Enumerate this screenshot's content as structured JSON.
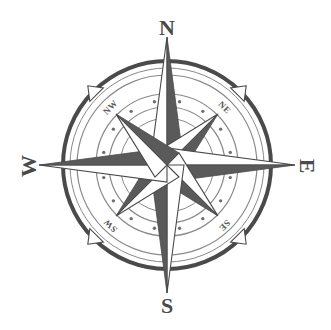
{
  "image": {
    "title": "Compass Rose",
    "kind": "compass-rose-illustration",
    "width": 331,
    "height": 330,
    "background_color": "#ffffff"
  },
  "colors": {
    "ink_dark": "#3f3f3f",
    "ink_mid": "#6b6b6b",
    "ink_light": "#8f8f8f",
    "ring_stroke": "#4a4a4a",
    "ring_thin": "#8a8a8a",
    "dot": "#6f6f6f",
    "star_dark": "#5a5a5a",
    "star_light": "#ffffff",
    "star_outline": "#4a4a4a",
    "label": "#4a4a4a"
  },
  "geometry": {
    "center_x": 167,
    "center_y": 165,
    "outer_ring_radius": 104,
    "outer_ring_width": 4,
    "mid_ring_radius": 90,
    "dot_ring_outer_radius": 71,
    "dot_ring_inner_radius": 58,
    "inner_ring_radius": 47,
    "cardinal_point_radius": 128,
    "intercardinal_point_radius": 72,
    "dot_count": 16
  },
  "labels": {
    "cardinal": [
      {
        "id": "north",
        "text": "N",
        "x": 167,
        "y": 30,
        "rotation": 0
      },
      {
        "id": "south",
        "text": "S",
        "x": 167,
        "y": 308,
        "rotation": 0
      },
      {
        "id": "west",
        "text": "W",
        "x": 31,
        "y": 166,
        "rotation": -90
      },
      {
        "id": "east",
        "text": "E",
        "x": 305,
        "y": 166,
        "rotation": 90
      }
    ],
    "intercardinal": [
      {
        "id": "northwest",
        "text": "NW",
        "x": 111,
        "y": 108,
        "rotation": -45
      },
      {
        "id": "northeast",
        "text": "NE",
        "x": 224,
        "y": 108,
        "rotation": 45
      },
      {
        "id": "southwest",
        "text": "SW",
        "x": 111,
        "y": 225,
        "rotation": -135
      },
      {
        "id": "southeast",
        "text": "SE",
        "x": 224,
        "y": 225,
        "rotation": 135
      }
    ]
  },
  "star": {
    "points": [
      {
        "id": "point-n",
        "angle": 0,
        "length": 128,
        "half_dark": "right"
      },
      {
        "id": "point-ne",
        "angle": 45,
        "length": 72,
        "half_dark": "right"
      },
      {
        "id": "point-e",
        "angle": 90,
        "length": 128,
        "half_dark": "right"
      },
      {
        "id": "point-se",
        "angle": 135,
        "length": 72,
        "half_dark": "right"
      },
      {
        "id": "point-s",
        "angle": 180,
        "length": 128,
        "half_dark": "right"
      },
      {
        "id": "point-sw",
        "angle": 225,
        "length": 72,
        "half_dark": "right"
      },
      {
        "id": "point-w",
        "angle": 270,
        "length": 128,
        "half_dark": "right"
      },
      {
        "id": "point-nw",
        "angle": 315,
        "length": 72,
        "half_dark": "right"
      }
    ],
    "half_width": 17
  },
  "fleur_ticks": [
    {
      "id": "tick-nw",
      "angle": 315
    },
    {
      "id": "tick-ne",
      "angle": 45
    },
    {
      "id": "tick-se",
      "angle": 135
    },
    {
      "id": "tick-sw",
      "angle": 225
    }
  ]
}
